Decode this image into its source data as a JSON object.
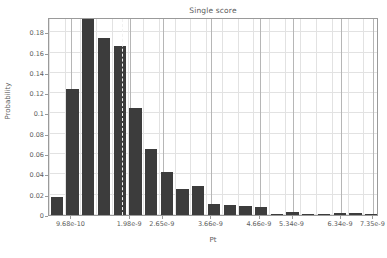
{
  "chart_data": {
    "type": "bar",
    "title": "Single score",
    "xlabel": "Pt",
    "ylabel": "Probability",
    "grid": true,
    "legend": null,
    "ylim": [
      0,
      0.195
    ],
    "ytick_labels": [
      "0",
      "0.02",
      "0.04",
      "0.06",
      "0.08",
      "0.1",
      "0.12",
      "0.14",
      "0.16",
      "0.18"
    ],
    "ytick_values": [
      0,
      0.02,
      0.04,
      0.06,
      0.08,
      0.1,
      0.12,
      0.14,
      0.16,
      0.18
    ],
    "xtick_labels": [
      "9.68e-10",
      "1.98e-9",
      "2.65e-9",
      "3.66e-9",
      "4.66e-9",
      "5.34e-9",
      "6.34e-9",
      "7.35e-9"
    ],
    "xtick_positions": [
      0.068,
      0.246,
      0.345,
      0.492,
      0.639,
      0.738,
      0.885,
      0.983
    ],
    "categories": [
      "9.68e-10",
      "1.30e-9",
      "1.64e-9",
      "1.98e-9",
      "2.31e-9",
      "2.65e-9",
      "2.99e-9",
      "3.32e-9",
      "3.66e-9",
      "3.99e-9",
      "4.33e-9",
      "4.66e-9",
      "5.00e-9",
      "5.34e-9",
      "5.67e-9",
      "6.01e-9",
      "6.34e-9",
      "6.68e-9",
      "7.01e-9",
      "7.35e-9",
      "7.68e-9"
    ],
    "values": [
      0.018,
      0.124,
      0.194,
      0.174,
      0.166,
      0.105,
      0.065,
      0.042,
      0.026,
      0.029,
      0.011,
      0.01,
      0.009,
      0.008,
      0.001,
      0.003,
      0.0005,
      0.0003,
      0.0015,
      0.0015,
      0.0005
    ],
    "bar_color": "#3c3c3c",
    "median_marker": {
      "label": "median",
      "position_fraction": 0.222,
      "color": "#f2f2f2",
      "style": "dashed"
    }
  }
}
